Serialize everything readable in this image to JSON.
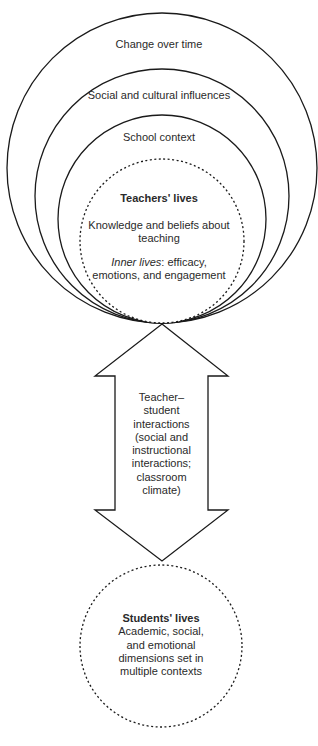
{
  "diagram": {
    "type": "nested-circles-with-bidirectional-arrow",
    "rings": [
      {
        "label": "Change over time"
      },
      {
        "label": "Social and cultural influences"
      },
      {
        "label": "School context"
      }
    ],
    "teachers": {
      "title": "Teachers' lives",
      "line1a": "Knowledge and beliefs about",
      "line1b": "teaching",
      "inner_italic": "Inner lives",
      "inner_rest": ": efficacy,",
      "line2b": "emotions, and engagement"
    },
    "arrow": {
      "lines": [
        "Teacher–",
        "student",
        "interactions",
        "(social and",
        "instructional",
        "interactions;",
        "classroom",
        "climate)"
      ]
    },
    "students": {
      "title": "Students' lives",
      "lines": [
        "Academic, social,",
        "and emotional",
        "dimensions set in",
        "multiple contexts"
      ]
    },
    "colors": {
      "stroke": "#1a1a1a",
      "text": "#2a2a2a",
      "background": "#ffffff"
    }
  }
}
